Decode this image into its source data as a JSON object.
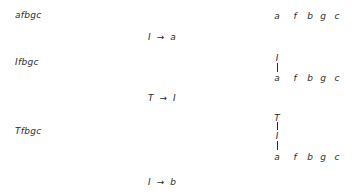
{
  "derivation": {
    "strings": [
      "afbgc",
      "Ifbgc",
      "Tfbgc"
    ],
    "rules": [
      {
        "lhs": "I",
        "arrow": "→",
        "rhs": "a"
      },
      {
        "lhs": "T",
        "arrow": "→",
        "rhs": "I"
      },
      {
        "lhs": "I",
        "arrow": "→",
        "rhs": "b"
      }
    ]
  },
  "trees": [
    {
      "nodes": [],
      "leaves": [
        "a",
        "f",
        "b",
        "g",
        "c"
      ]
    },
    {
      "nodes": [
        "I"
      ],
      "leaves": [
        "a",
        "f",
        "b",
        "g",
        "c"
      ]
    },
    {
      "nodes": [
        "T",
        "I"
      ],
      "leaves": [
        "a",
        "f",
        "b",
        "g",
        "c"
      ]
    }
  ]
}
